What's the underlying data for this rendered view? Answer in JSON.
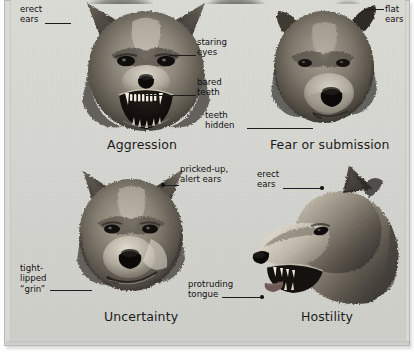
{
  "figure": {
    "panels": [
      {
        "id": "aggression",
        "caption": "Aggression",
        "annotations": [
          {
            "id": "erect-ears",
            "text": "erect\near s"
          },
          {
            "id": "staring-eyes",
            "text": "staring\neyes"
          },
          {
            "id": "bared-teeth",
            "text": "bared\nteeth"
          }
        ]
      },
      {
        "id": "fear-or-submission",
        "caption": "Fear or submission",
        "annotations": [
          {
            "id": "flat-ears",
            "text": "flat\nears"
          },
          {
            "id": "teeth-hidden",
            "text": "teeth\nhidden"
          }
        ]
      },
      {
        "id": "uncertainty",
        "caption": "Uncertainty",
        "annotations": [
          {
            "id": "pricked-up-alert-ears",
            "text": "pricked-up,\nalert ears"
          },
          {
            "id": "tight-lipped-grin",
            "text": "tight-\nlipped\n“grin”"
          }
        ]
      },
      {
        "id": "hostility",
        "caption": "Hostility",
        "annotations": [
          {
            "id": "erect-ears-2",
            "text": "erect\nears"
          },
          {
            "id": "protruding-tongue",
            "text": "protruding\ntongue"
          }
        ]
      }
    ],
    "labels": {
      "erect_ears_line1": "erect",
      "erect_ears_line2": "ears",
      "staring_eyes_line1": "staring",
      "staring_eyes_line2": "eyes",
      "bared_teeth_line1": "bared",
      "bared_teeth_line2": "teeth",
      "flat_ears_line1": "flat",
      "flat_ears_line2": "ears",
      "teeth_hidden_line1": "teeth",
      "teeth_hidden_line2": "hidden",
      "pricked_up_line1": "pricked-up,",
      "pricked_up_line2": "alert ears",
      "erect_ears2_line1": "erect",
      "erect_ears2_line2": "ears",
      "tight_lipped_line1": "tight-",
      "tight_lipped_line2": "lipped",
      "tight_lipped_line3": "“grin”",
      "protruding_line1": "protruding",
      "protruding_line2": "tongue"
    },
    "captions": {
      "aggression": "Aggression",
      "fear_or_submission": "Fear or submission",
      "uncertainty": "Uncertainty",
      "hostility": "Hostility"
    },
    "colors": {
      "page_background": "#ffffff",
      "plate_background": "#d8d8d3",
      "frame_border": "#b9b9b4",
      "text": "#111111",
      "caption_text": "#1b1b1b",
      "leader_line": "#1d1d1d",
      "fur_dark": "#3a362f",
      "fur_mid": "#7d766a",
      "fur_light": "#c6c0b3",
      "nose_black": "#0d0c0b",
      "mouth_black": "#120f0d",
      "tooth_white": "#f2efe6",
      "tongue_pink": "#6e5a55"
    }
  }
}
